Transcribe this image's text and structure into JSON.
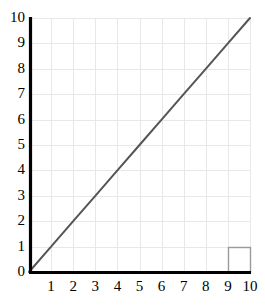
{
  "chart_data": {
    "type": "line",
    "title": "",
    "subtitle": "",
    "xlabel": "",
    "ylabel": "",
    "xlim": [
      0,
      10
    ],
    "ylim": [
      0,
      10
    ],
    "grid": true,
    "legend": "none",
    "x_ticks": [
      "0",
      "1",
      "2",
      "3",
      "4",
      "5",
      "6",
      "7",
      "8",
      "9",
      "10"
    ],
    "y_ticks": [
      "0",
      "1",
      "2",
      "3",
      "4",
      "5",
      "6",
      "7",
      "8",
      "9",
      "10"
    ],
    "series": [
      {
        "name": "y = x",
        "x": [
          0,
          1,
          2,
          3,
          4,
          5,
          6,
          7,
          8,
          9,
          10
        ],
        "values": [
          0,
          1,
          2,
          3,
          4,
          5,
          6,
          7,
          8,
          9,
          10
        ],
        "color": "#555555",
        "line_width": 2
      }
    ],
    "annotations": [
      {
        "name": "highlighted-cell",
        "x_range": [
          9,
          10
        ],
        "y_range": [
          0,
          1
        ],
        "border_color": "#9a9a9a"
      }
    ]
  },
  "style": {
    "background": "#ffffff",
    "grid_color": "#e8e8e8",
    "axis_color": "#000000",
    "tick_label_color": "#000000",
    "line_color": "#555555",
    "highlight_border_color": "#9a9a9a"
  },
  "geometry": {
    "plot_left": 29,
    "plot_right": 250,
    "plot_top": 18,
    "plot_bottom": 272
  }
}
